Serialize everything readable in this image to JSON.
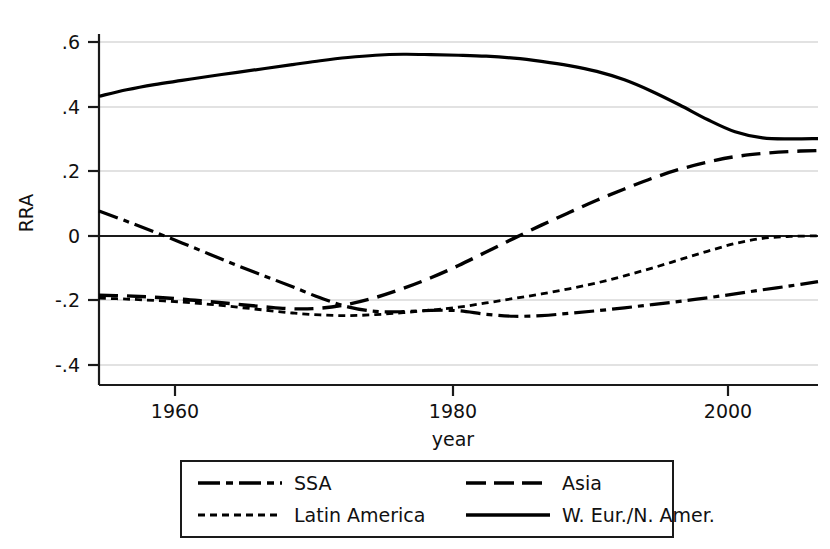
{
  "chart_data": {
    "type": "line",
    "title": "",
    "xlabel": "year",
    "ylabel": "RRA",
    "xlim": [
      1954,
      2006
    ],
    "ylim": [
      -0.4,
      0.6
    ],
    "grid": true,
    "grid_axis": "y",
    "legend_position": "below",
    "x_ticks": [
      1960,
      1980,
      2000
    ],
    "x_tick_labels": [
      "1960",
      "1980",
      "2000"
    ],
    "y_ticks": [
      0.6,
      0.4,
      0.2,
      0,
      -0.2,
      -0.4
    ],
    "y_tick_labels": [
      ".6",
      ".4",
      ".2",
      "0",
      "-.2",
      "-.4"
    ],
    "zero_reference_line": 0,
    "x": [
      1954,
      1956,
      1958,
      1960,
      1962,
      1964,
      1966,
      1968,
      1970,
      1972,
      1974,
      1976,
      1978,
      1980,
      1982,
      1984,
      1986,
      1988,
      1990,
      1992,
      1994,
      1996,
      1998,
      2000,
      2002,
      2004,
      2006
    ],
    "series": [
      {
        "name": "SSA",
        "style": "dash-dot",
        "color": "#000000",
        "values": [
          0.077,
          0.045,
          0.012,
          -0.022,
          -0.057,
          -0.092,
          -0.125,
          -0.158,
          -0.192,
          -0.22,
          -0.234,
          -0.235,
          -0.231,
          -0.232,
          -0.243,
          -0.249,
          -0.247,
          -0.24,
          -0.232,
          -0.223,
          -0.213,
          -0.203,
          -0.192,
          -0.18,
          -0.167,
          -0.155,
          -0.142
        ]
      },
      {
        "name": "Latin America",
        "style": "fine-dotted",
        "color": "#000000",
        "values": [
          -0.193,
          -0.196,
          -0.2,
          -0.205,
          -0.212,
          -0.221,
          -0.23,
          -0.239,
          -0.245,
          -0.247,
          -0.244,
          -0.238,
          -0.23,
          -0.221,
          -0.208,
          -0.194,
          -0.18,
          -0.164,
          -0.146,
          -0.124,
          -0.1,
          -0.074,
          -0.048,
          -0.024,
          -0.008,
          -0.002,
          0.0
        ]
      },
      {
        "name": "Asia",
        "style": "long-dash",
        "color": "#000000",
        "values": [
          -0.184,
          -0.186,
          -0.19,
          -0.196,
          -0.204,
          -0.212,
          -0.22,
          -0.226,
          -0.224,
          -0.212,
          -0.191,
          -0.163,
          -0.13,
          -0.092,
          -0.05,
          -0.008,
          0.033,
          0.072,
          0.11,
          0.145,
          0.178,
          0.206,
          0.228,
          0.245,
          0.255,
          0.261,
          0.264
        ]
      },
      {
        "name": "W. Eur./N. Amer.",
        "style": "solid",
        "color": "#000000",
        "values": [
          0.432,
          0.452,
          0.468,
          0.481,
          0.494,
          0.506,
          0.518,
          0.53,
          0.542,
          0.552,
          0.559,
          0.562,
          0.561,
          0.559,
          0.556,
          0.55,
          0.54,
          0.527,
          0.509,
          0.483,
          0.447,
          0.405,
          0.36,
          0.322,
          0.303,
          0.3,
          0.301
        ]
      }
    ],
    "legend_entries": [
      {
        "label": "SSA",
        "style": "dash-dot"
      },
      {
        "label": "Asia",
        "style": "long-dash"
      },
      {
        "label": "Latin America",
        "style": "fine-dotted"
      },
      {
        "label": "W. Eur./N. Amer.",
        "style": "solid"
      }
    ]
  }
}
